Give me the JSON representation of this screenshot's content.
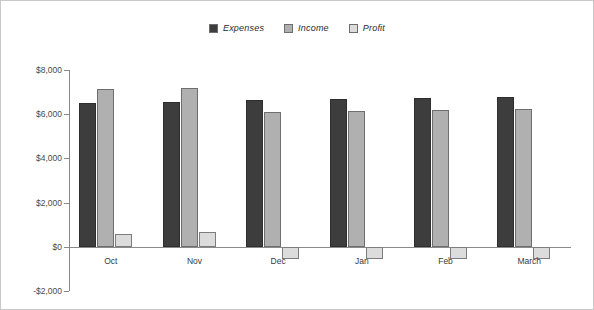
{
  "chart_data": {
    "type": "bar",
    "title": "",
    "xlabel": "",
    "ylabel": "",
    "grid": false,
    "legend_position": "top-center",
    "ylim": [
      -2000,
      8000
    ],
    "ytick_labels": [
      "$8,000",
      "$6,000",
      "$4,000",
      "$2,000",
      "$0",
      "-$2,000"
    ],
    "ytick_values": [
      8000,
      6000,
      4000,
      2000,
      0,
      -2000
    ],
    "categories": [
      "Oct",
      "Nov",
      "Dec",
      "Jan",
      "Feb",
      "March"
    ],
    "series": [
      {
        "name": "Expenses",
        "color": "#3d3d3d",
        "values": [
          6500,
          6550,
          6650,
          6700,
          6750,
          6780
        ]
      },
      {
        "name": "Income",
        "color": "#b0b0b0",
        "values": [
          7150,
          7200,
          6100,
          6150,
          6200,
          6230
        ]
      },
      {
        "name": "Profit",
        "color": "#dcdcdc",
        "values": [
          600,
          680,
          -550,
          -550,
          -550,
          -540
        ]
      }
    ]
  },
  "legend": {
    "items": [
      {
        "label": "Expenses",
        "color": "#3d3d3d"
      },
      {
        "label": "Income",
        "color": "#b0b0b0"
      },
      {
        "label": "Profit",
        "color": "#dcdcdc"
      }
    ]
  }
}
